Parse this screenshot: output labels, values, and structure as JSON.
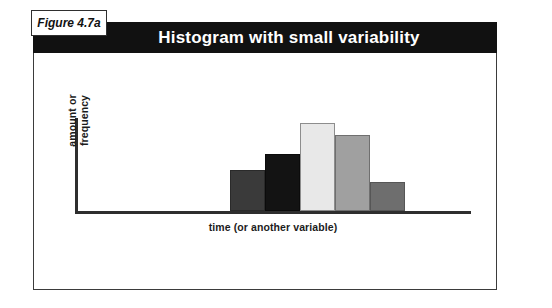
{
  "figure": {
    "tag_label": "Figure 4.7a",
    "title": "Histogram with small variability"
  },
  "chart_data": {
    "type": "bar",
    "title": "Histogram with small variability",
    "xlabel": "time (or another variable)",
    "ylabel_line1": "amount or",
    "ylabel_line2": "frequency",
    "ylabel": "amount or frequency",
    "grid": false,
    "legend": "none",
    "axis_color": "#2e2e2e",
    "categories": [
      "1",
      "2",
      "3",
      "4",
      "5"
    ],
    "values": [
      29,
      41,
      63,
      54,
      21
    ],
    "ylim": [
      0,
      70
    ],
    "bar_colors": [
      "#3a3a3a",
      "#131313",
      "#e8e8e8",
      "#a0a0a0",
      "#6e6e6e"
    ],
    "bars": [
      {
        "index": 1,
        "value": 29,
        "color": "#3a3a3a",
        "outline": "#2a2a2a"
      },
      {
        "index": 2,
        "value": 41,
        "color": "#131313",
        "outline": "#0b0b0b"
      },
      {
        "index": 3,
        "value": 63,
        "color": "#e8e8e8",
        "outline": "#8d8d8d"
      },
      {
        "index": 4,
        "value": 54,
        "color": "#a0a0a0",
        "outline": "#6f6f6f"
      },
      {
        "index": 5,
        "value": 21,
        "color": "#6e6e6e",
        "outline": "#565656"
      }
    ]
  }
}
